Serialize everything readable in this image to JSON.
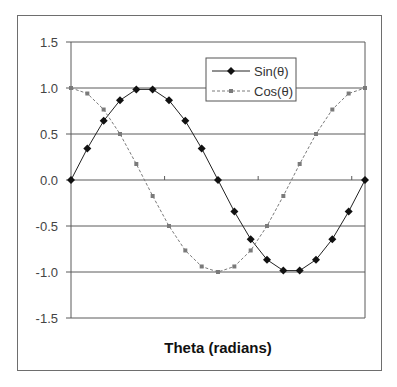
{
  "chart_data": {
    "type": "line",
    "title": "",
    "xlabel": "Theta (radians)",
    "ylabel": "",
    "xlim": [
      0,
      6.2832
    ],
    "ylim": [
      -1.5,
      1.5
    ],
    "y_ticks": [
      1.5,
      1.0,
      0.5,
      0.0,
      -0.5,
      -1.0,
      -1.5
    ],
    "y_tick_labels": [
      "1.5",
      "1.0",
      "0.5",
      "0.0",
      "-0.5",
      "-1.0",
      "-1.5"
    ],
    "x_ticks": [
      2,
      4,
      6
    ],
    "x_tick_labels": [],
    "grid": "horizontal",
    "legend_position": "upper-center-right",
    "x": [
      0,
      0.349,
      0.698,
      1.047,
      1.396,
      1.745,
      2.094,
      2.443,
      2.793,
      3.142,
      3.491,
      3.84,
      4.189,
      4.538,
      4.887,
      5.236,
      5.585,
      5.934,
      6.283
    ],
    "series": [
      {
        "name": "Sin(θ)",
        "style": "solid",
        "marker": "diamond",
        "color": "#222222",
        "values": [
          0.0,
          0.342,
          0.643,
          0.866,
          0.985,
          0.985,
          0.866,
          0.643,
          0.342,
          0.0,
          -0.342,
          -0.643,
          -0.866,
          -0.985,
          -0.985,
          -0.866,
          -0.643,
          -0.342,
          0.0
        ]
      },
      {
        "name": "Cos(θ)",
        "style": "dashed",
        "marker": "square",
        "color": "#7a7a7a",
        "values": [
          1.0,
          0.94,
          0.766,
          0.5,
          0.174,
          -0.174,
          -0.5,
          -0.766,
          -0.94,
          -1.0,
          -0.94,
          -0.766,
          -0.5,
          -0.174,
          0.174,
          0.5,
          0.766,
          0.94,
          1.0
        ]
      }
    ]
  },
  "legend": {
    "items": [
      "Sin(θ)",
      "Cos(θ)"
    ]
  },
  "axis": {
    "x_title": "Theta (radians)"
  }
}
